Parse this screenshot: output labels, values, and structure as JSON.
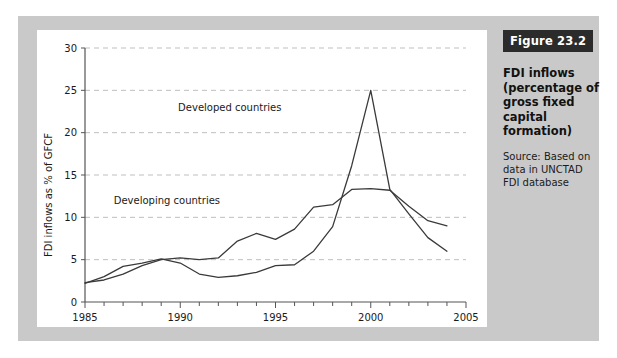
{
  "caption": {
    "badge": "Figure 23.2",
    "title": "FDI inflows (percentage of gross fixed capital formation)",
    "source": "Source: Based on data in UNCTAD FDI database"
  },
  "chart_data": {
    "type": "line",
    "title": "FDI inflows (percentage of gross fixed capital formation)",
    "xlabel": "",
    "ylabel": "FDI inflows as % of GFCF",
    "xlim": [
      1985,
      2005
    ],
    "ylim": [
      0,
      30
    ],
    "xticks": [
      1985,
      1990,
      1995,
      2000,
      2005
    ],
    "xtick_labels": [
      "1985",
      "1990",
      "1995",
      "2000",
      "2005"
    ],
    "x_minor_tick_step": 1,
    "yticks": [
      0,
      5,
      10,
      15,
      20,
      25,
      30
    ],
    "ytick_labels": [
      "0",
      "5",
      "10",
      "15",
      "20",
      "25",
      "30"
    ],
    "grid": "horizontal-dashed",
    "legend": "inline-annotations",
    "x": [
      1985,
      1986,
      1987,
      1988,
      1989,
      1990,
      1991,
      1992,
      1993,
      1994,
      1995,
      1996,
      1997,
      1998,
      1999,
      2000,
      2001,
      2002,
      2003,
      2004
    ],
    "series": [
      {
        "name": "Developed countries",
        "label_x": 1992.6,
        "label_y": 22.6,
        "values": [
          2.2,
          3.0,
          4.2,
          4.6,
          5.1,
          4.6,
          3.3,
          2.9,
          3.1,
          3.5,
          4.3,
          4.4,
          6.0,
          8.9,
          16.1,
          25.0,
          13.3,
          10.4,
          7.6,
          6.0
        ]
      },
      {
        "name": "Developing countries",
        "label_x": 1989.3,
        "label_y": 11.6,
        "values": [
          2.3,
          2.6,
          3.3,
          4.3,
          5.0,
          5.2,
          5.0,
          5.2,
          7.2,
          8.1,
          7.4,
          8.6,
          11.2,
          11.5,
          13.3,
          13.4,
          13.2,
          11.3,
          9.6,
          9.0
        ]
      }
    ]
  }
}
